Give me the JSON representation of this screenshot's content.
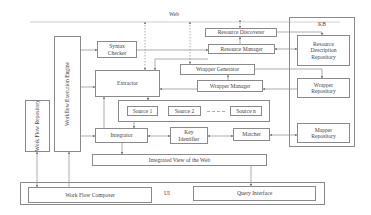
{
  "diagram": {
    "web_label": "Web",
    "kb_label": "KB",
    "ui_label": "UI",
    "nodes": {
      "workflow_execution_engine": "Workflow Execution Engine",
      "work_flow_repository": "Work Flow Repository",
      "syntax_checker_line1": "Syntax",
      "syntax_checker_line2": "Checker",
      "extractor": "Extractor",
      "resource_discoverer": "Resource Discoverer",
      "resource_manager": "Resource Manager",
      "wrapper_generator": "Wrapper Generator",
      "wrapper_manager": "Wrapper Manager",
      "source_1": "Source 1",
      "source_2": "Source 2",
      "source_n": "Source n",
      "integrator": "Integrator",
      "key_identifier_line1": "Key",
      "key_identifier_line2": "Identifier",
      "matcher": "Matcher",
      "integrated_view": "Integrated View of the Web",
      "resource_description_repository_line1": "Resource",
      "resource_description_repository_line2": "Description",
      "resource_description_repository_line3": "Repository",
      "wrapper_repository_line1": "Wrapper",
      "wrapper_repository_line2": "Repository",
      "mapper_repository_line1": "Mapper",
      "mapper_repository_line2": "Repository",
      "work_flow_composer": "Work Flow Composer",
      "query_interface": "Query Interface"
    },
    "colors": {
      "line": "#8a8a8a",
      "text": "#444444",
      "background": "#ffffff"
    }
  }
}
